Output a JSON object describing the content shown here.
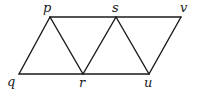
{
  "diagram": {
    "type": "geometry",
    "points": [
      {
        "id": "p",
        "label": "p",
        "x": 50,
        "y": 17,
        "lx": 43,
        "ly": 12
      },
      {
        "id": "s",
        "label": "s",
        "x": 116,
        "y": 17,
        "lx": 112,
        "ly": 12
      },
      {
        "id": "v",
        "label": "v",
        "x": 181,
        "y": 17,
        "lx": 180,
        "ly": 12
      },
      {
        "id": "q",
        "label": "q",
        "x": 19,
        "y": 74,
        "lx": 7,
        "ly": 86
      },
      {
        "id": "r",
        "label": "r",
        "x": 83,
        "y": 74,
        "lx": 79,
        "ly": 87
      },
      {
        "id": "u",
        "label": "u",
        "x": 149,
        "y": 74,
        "lx": 144,
        "ly": 87
      }
    ],
    "edges": [
      [
        "p",
        "v"
      ],
      [
        "q",
        "u"
      ],
      [
        "q",
        "p"
      ],
      [
        "p",
        "r"
      ],
      [
        "r",
        "s"
      ],
      [
        "s",
        "u"
      ],
      [
        "u",
        "v"
      ]
    ],
    "labels": {
      "p": "p",
      "s": "s",
      "v": "v",
      "q": "q",
      "r": "r",
      "u": "u"
    }
  }
}
